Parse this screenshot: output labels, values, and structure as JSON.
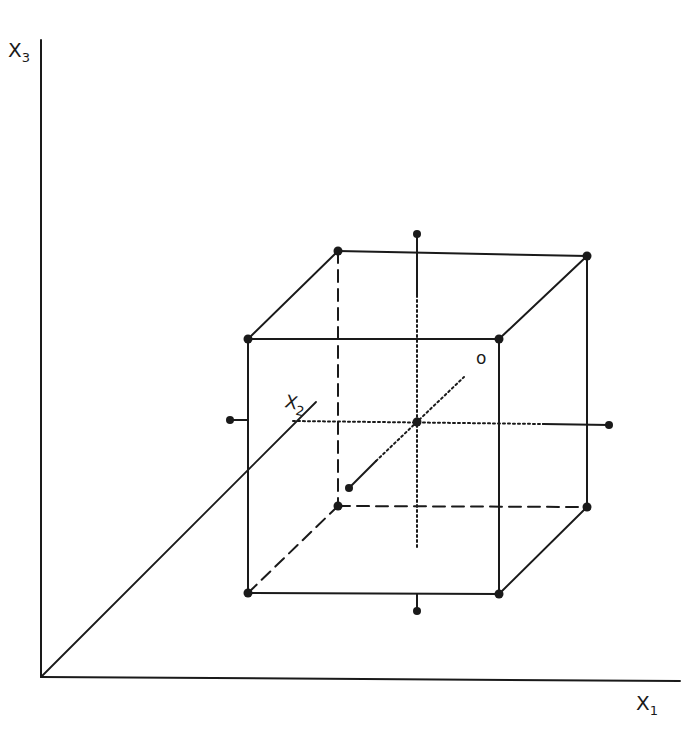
{
  "diagram": {
    "type": "central composite design (3 factors) in coordinate space",
    "axes": {
      "x1": {
        "label": "X",
        "subscript": "1"
      },
      "x2": {
        "label": "X",
        "subscript": "2"
      },
      "x3": {
        "label": "X",
        "subscript": "3"
      }
    },
    "center_label": "o",
    "colors": {
      "ink": "#1a1a1a",
      "background": "#ffffff"
    },
    "points": {
      "cube_corners": 8,
      "axial_points": 6,
      "center_point": 1
    }
  }
}
